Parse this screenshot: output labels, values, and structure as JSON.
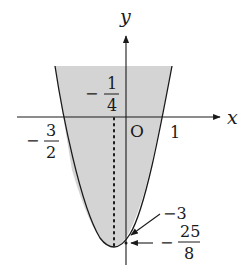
{
  "diagram": {
    "type": "parabola-graph",
    "axes": {
      "x_label": "x",
      "y_label": "y",
      "origin_label": "O"
    },
    "curve": {
      "description": "upward-opening parabola with shaded interior region",
      "shading_color": "#d4d4d4",
      "line_color": "#1a1a1a"
    },
    "labels": {
      "axis_of_symmetry": {
        "sign": "−",
        "numerator": "1",
        "denominator": "4"
      },
      "left_root": {
        "sign": "−",
        "numerator": "3",
        "denominator": "2"
      },
      "right_root": "1",
      "y_intercept": "−3",
      "vertex_y": {
        "sign": "−",
        "numerator": "25",
        "denominator": "8"
      }
    }
  }
}
